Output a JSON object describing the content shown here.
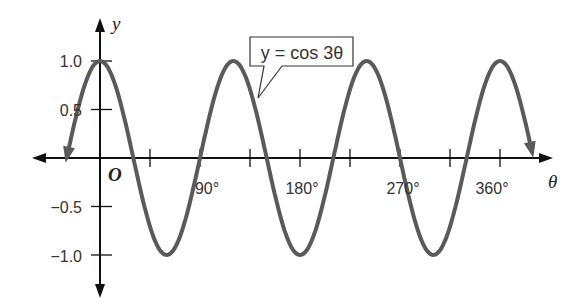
{
  "chart_data": {
    "type": "line",
    "title": "",
    "equation_label": "y = cos 3θ",
    "xlabel": "θ",
    "ylabel": "y",
    "origin_label": "O",
    "x_tick_labels": [
      "90°",
      "180°",
      "270°",
      "360°"
    ],
    "x_tick_values_deg": [
      45,
      90,
      135,
      180,
      225,
      270,
      315,
      360
    ],
    "y_tick_labels": [
      "1.0",
      "0.5",
      "−0.5",
      "−1.0"
    ],
    "y_tick_values": [
      1.0,
      0.5,
      -0.5,
      -1.0
    ],
    "xlim_deg": [
      -35,
      395
    ],
    "ylim": [
      -1.4,
      1.4
    ],
    "grid": false,
    "series": [
      {
        "name": "y = cos 3θ",
        "function": "cos(3θ)",
        "x_deg_range": [
          -30,
          390
        ],
        "x": [
          0,
          30,
          60,
          90,
          120,
          150,
          180,
          210,
          240,
          270,
          300,
          330,
          360
        ],
        "values": [
          1,
          0,
          -1,
          0,
          1,
          0,
          -1,
          0,
          1,
          0,
          -1,
          0,
          1
        ]
      }
    ],
    "colors": {
      "curve": "#5a5a5a",
      "axes": "#111111"
    }
  }
}
